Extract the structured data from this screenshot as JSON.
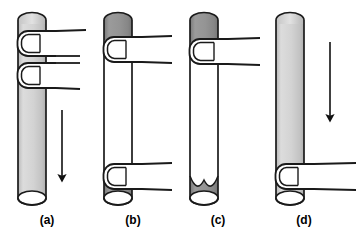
{
  "figure": {
    "background_color": "#ffffff",
    "stroke_color": "#1a1a1a",
    "fill_light": "#cfcfcf",
    "fill_dark": "#8d8d8d",
    "fill_empty": "#ffffff",
    "panel_count": 4
  },
  "panels": [
    {
      "id": "a",
      "caption": "(a)",
      "caption_x": 47,
      "caption_y": 224,
      "tube": {
        "x": 18,
        "y": 13,
        "width": 28,
        "height": 192,
        "cap_ry": 7,
        "fill": "#cfcfcf",
        "fill_description": "light gray along the entire tube length"
      },
      "liquid_regions": [
        {
          "name": "full-column",
          "from_y": 13,
          "to_y": 205,
          "shade": "light"
        }
      ],
      "fingers": [
        {
          "name": "finger-upper",
          "x": 18,
          "y": 30,
          "width": 38,
          "height": 26,
          "direction": "right"
        },
        {
          "name": "finger-lower",
          "x": 18,
          "y": 62,
          "width": 38,
          "height": 26,
          "direction": "right"
        }
      ],
      "arrow": {
        "name": "flow-arrow-down",
        "x": 62,
        "y_start": 110,
        "y_end": 180,
        "direction": "down"
      }
    },
    {
      "id": "b",
      "caption": "(b)",
      "caption_x": 133,
      "caption_y": 224,
      "tube": {
        "x": 104,
        "y": 13,
        "width": 28,
        "height": 192,
        "cap_ry": 7,
        "fill": "#ffffff",
        "fill_description": "dark gray plug at top and at bottom, clear in the middle"
      },
      "liquid_regions": [
        {
          "name": "top-plug",
          "from_y": 13,
          "to_y": 40,
          "shade": "dark"
        },
        {
          "name": "middle-gap",
          "from_y": 40,
          "to_y": 170,
          "shade": "empty"
        },
        {
          "name": "bottom-plug",
          "from_y": 170,
          "to_y": 205,
          "shade": "dark"
        }
      ],
      "fingers": [
        {
          "name": "finger-upper",
          "x": 104,
          "y": 36,
          "width": 38,
          "height": 26,
          "direction": "right"
        },
        {
          "name": "finger-lower",
          "x": 104,
          "y": 163,
          "width": 38,
          "height": 26,
          "direction": "right"
        }
      ],
      "arrow": null
    },
    {
      "id": "c",
      "caption": "(c)",
      "caption_x": 218,
      "caption_y": 224,
      "tube": {
        "x": 190,
        "y": 13,
        "width": 28,
        "height": 192,
        "cap_ry": 7,
        "fill": "#ffffff",
        "fill_description": "dark gray plug at top, clear middle, dark pool with concave V meniscus at bottom"
      },
      "liquid_regions": [
        {
          "name": "top-plug",
          "from_y": 13,
          "to_y": 42,
          "shade": "dark"
        },
        {
          "name": "middle-gap",
          "from_y": 42,
          "to_y": 176,
          "shade": "empty"
        },
        {
          "name": "bottom-pool-v-meniscus",
          "from_y": 176,
          "to_y": 205,
          "shade": "dark"
        }
      ],
      "fingers": [
        {
          "name": "finger-upper",
          "x": 190,
          "y": 38,
          "width": 38,
          "height": 26,
          "direction": "right"
        }
      ],
      "arrow": null
    },
    {
      "id": "d",
      "caption": "(d)",
      "caption_x": 304,
      "caption_y": 224,
      "tube": {
        "x": 276,
        "y": 13,
        "width": 28,
        "height": 192,
        "cap_ry": 7,
        "fill": "#cfcfcf",
        "fill_description": "light gray along the entire tube length"
      },
      "liquid_regions": [
        {
          "name": "full-column",
          "from_y": 13,
          "to_y": 205,
          "shade": "light"
        }
      ],
      "fingers": [
        {
          "name": "finger-lower",
          "x": 276,
          "y": 163,
          "width": 38,
          "height": 26,
          "direction": "right"
        }
      ],
      "arrow": {
        "name": "flow-arrow-down",
        "x": 330,
        "y_start": 42,
        "y_end": 120,
        "direction": "down"
      }
    }
  ]
}
